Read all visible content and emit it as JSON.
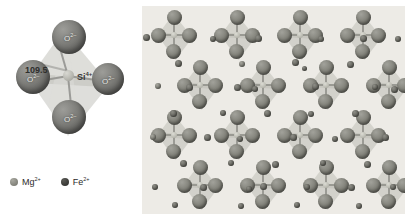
{
  "figure": {
    "background_color": "#ffffff"
  },
  "left_panel": {
    "name": "silicate-tetrahedron-diagram",
    "background_color": "#ffffff",
    "center_atom": {
      "label": "Si",
      "charge": "4+",
      "full_label": "Si4+",
      "color": "#c4c4bd"
    },
    "angle": {
      "value": "109.5",
      "label": "109.5",
      "unit": "degrees"
    },
    "oxygen_atoms": [
      {
        "position": "top",
        "label": "O",
        "charge": "2–",
        "color": "#6d6d69"
      },
      {
        "position": "left",
        "label": "O",
        "charge": "2–",
        "color": "#6d6d69"
      },
      {
        "position": "right",
        "label": "O",
        "charge": "2–",
        "color": "#6d6d69"
      },
      {
        "position": "bottom",
        "label": "O",
        "charge": "2–",
        "color": "#6d6d69"
      }
    ],
    "face_color": "#c9c9c4"
  },
  "legend": {
    "name": "ion-legend",
    "items": [
      {
        "label": "Mg",
        "charge": "2+",
        "full_label": "Mg2+",
        "color": "#8a8a82"
      },
      {
        "label": "Fe",
        "charge": "2+",
        "full_label": "Fe2+",
        "color": "#3f3f3b"
      }
    ]
  },
  "right_panel": {
    "name": "olivine-crystal-structure",
    "background_color": "#edebe6",
    "description": "Repeating lattice of silicate tetrahedra with interstitial Mg2+ and Fe2+ cations",
    "tetrahedra_rows": 4,
    "tetrahedra_columns": 4,
    "tetrahedron_color": "#cbcbc3",
    "oxygen_color": "#85857d",
    "cation_color": "#4e4e48"
  }
}
